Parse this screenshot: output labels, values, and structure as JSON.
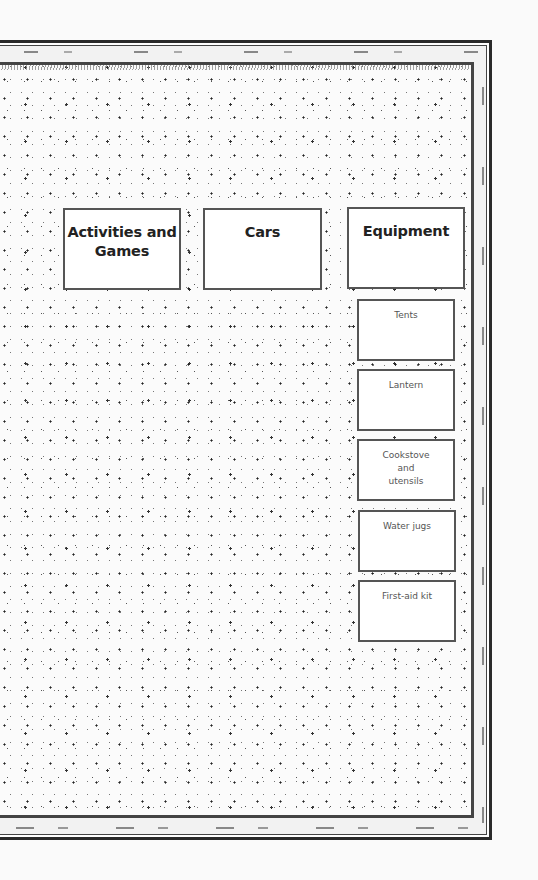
{
  "board": {
    "categories": [
      {
        "id": "activities",
        "label": "Activities and Games"
      },
      {
        "id": "cars",
        "label": "Cars"
      },
      {
        "id": "equipment",
        "label": "Equipment"
      }
    ],
    "equipment_items": [
      {
        "label": "Tents"
      },
      {
        "label": "Lantern"
      },
      {
        "label": "Cookstove and utensils"
      },
      {
        "label": "Water jugs"
      },
      {
        "label": "First-aid kit"
      }
    ]
  }
}
